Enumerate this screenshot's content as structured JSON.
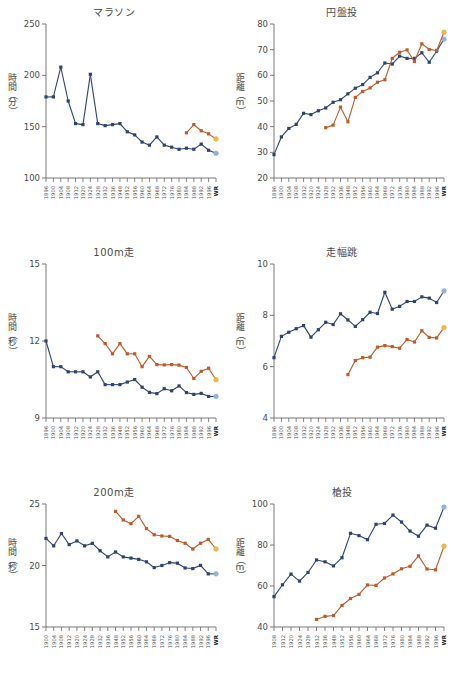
{
  "figure": {
    "background": "#ffffff",
    "series_colors": {
      "men": "#2e4373",
      "women": "#c05a28",
      "men_wr": "#8fb3d9",
      "women_wr": "#efb54a"
    },
    "legend_note": ""
  },
  "chart_data": [
    {
      "type": "line",
      "id": "marathon",
      "title": "マラソン",
      "ylabel_chars": [
        "時",
        "間",
        "（",
        "分",
        "）"
      ],
      "ylabel": "時間（分）",
      "xlabel": "",
      "ylim": [
        100,
        250
      ],
      "yticks": [
        100,
        150,
        200,
        250
      ],
      "grid": false,
      "categories": [
        "1896",
        "1900",
        "1904",
        "1908",
        "1912",
        "1920",
        "1924",
        "1928",
        "1932",
        "1936",
        "1948",
        "1952",
        "1956",
        "1960",
        "1964",
        "1968",
        "1972",
        "1976",
        "1980",
        "1984",
        "1988",
        "1992",
        "1996",
        "WR"
      ],
      "series": [
        {
          "name": "men",
          "color": "#2e4373",
          "last_is_wr": true,
          "values": [
            179,
            179,
            208,
            175,
            153,
            152,
            201,
            153,
            151,
            152,
            153,
            145,
            142,
            135,
            132,
            140,
            132,
            130,
            128,
            129,
            128,
            133,
            127,
            124
          ]
        },
        {
          "name": "women",
          "color": "#c05a28",
          "last_is_wr": true,
          "values": [
            null,
            null,
            null,
            null,
            null,
            null,
            null,
            null,
            null,
            null,
            null,
            null,
            null,
            null,
            null,
            null,
            null,
            null,
            null,
            144,
            152,
            146,
            143,
            138
          ]
        }
      ]
    },
    {
      "type": "line",
      "id": "discus",
      "title": "円盤投",
      "ylabel_chars": [
        "距",
        "離",
        "（",
        "m",
        "）"
      ],
      "ylabel": "距離（m）",
      "xlabel": "",
      "ylim": [
        20,
        80
      ],
      "yticks": [
        20,
        30,
        40,
        50,
        60,
        70,
        80
      ],
      "grid": false,
      "categories": [
        "1896",
        "1900",
        "1904",
        "1908",
        "1912",
        "1920",
        "1924",
        "1928",
        "1932",
        "1936",
        "1948",
        "1952",
        "1956",
        "1960",
        "1964",
        "1968",
        "1972",
        "1976",
        "1980",
        "1984",
        "1988",
        "1992",
        "1996",
        "WR"
      ],
      "series": [
        {
          "name": "men",
          "color": "#2e4373",
          "last_is_wr": true,
          "values": [
            29.1,
            36.0,
            39.3,
            40.9,
            45.2,
            44.7,
            46.2,
            47.3,
            49.5,
            50.5,
            52.8,
            55.0,
            56.4,
            59.2,
            61.0,
            64.8,
            64.4,
            67.5,
            66.6,
            66.6,
            68.8,
            65.1,
            69.4,
            74.1
          ]
        },
        {
          "name": "women",
          "color": "#c05a28",
          "last_is_wr": true,
          "values": [
            null,
            null,
            null,
            null,
            null,
            null,
            null,
            39.6,
            40.6,
            47.6,
            41.9,
            51.4,
            53.7,
            55.1,
            57.3,
            58.3,
            66.6,
            69.0,
            69.9,
            65.4,
            72.3,
            70.1,
            69.7,
            76.8
          ]
        }
      ]
    },
    {
      "type": "line",
      "id": "sprint100",
      "title": "100m走",
      "ylabel_chars": [
        "時",
        "間",
        "（",
        "秒",
        "）"
      ],
      "ylabel": "時間（秒）",
      "xlabel": "",
      "ylim": [
        9,
        15
      ],
      "yticks": [
        9,
        12,
        15
      ],
      "grid": false,
      "categories": [
        "1896",
        "1900",
        "1904",
        "1908",
        "1912",
        "1920",
        "1924",
        "1928",
        "1932",
        "1936",
        "1948",
        "1952",
        "1956",
        "1960",
        "1964",
        "1968",
        "1972",
        "1976",
        "1980",
        "1984",
        "1988",
        "1992",
        "1996",
        "WR"
      ],
      "series": [
        {
          "name": "men",
          "color": "#2e4373",
          "last_is_wr": true,
          "values": [
            12.0,
            11.0,
            11.0,
            10.8,
            10.8,
            10.8,
            10.6,
            10.8,
            10.3,
            10.3,
            10.3,
            10.4,
            10.5,
            10.2,
            10.0,
            9.95,
            10.14,
            10.06,
            10.25,
            9.99,
            9.92,
            9.96,
            9.84,
            9.84
          ]
        },
        {
          "name": "women",
          "color": "#c05a28",
          "last_is_wr": true,
          "values": [
            null,
            null,
            null,
            null,
            null,
            null,
            null,
            12.2,
            11.9,
            11.5,
            11.9,
            11.5,
            11.5,
            11.0,
            11.4,
            11.08,
            11.07,
            11.08,
            11.06,
            10.97,
            10.54,
            10.82,
            10.94,
            10.49
          ]
        }
      ]
    },
    {
      "type": "line",
      "id": "longjump",
      "title": "走幅跳",
      "ylabel_chars": [
        "距",
        "離",
        "（",
        "m",
        "）"
      ],
      "ylabel": "距離（m）",
      "xlabel": "",
      "ylim": [
        4,
        10
      ],
      "yticks": [
        4,
        6,
        8,
        10
      ],
      "grid": false,
      "categories": [
        "1896",
        "1900",
        "1904",
        "1908",
        "1912",
        "1920",
        "1924",
        "1928",
        "1932",
        "1936",
        "1948",
        "1952",
        "1956",
        "1960",
        "1964",
        "1968",
        "1972",
        "1976",
        "1980",
        "1984",
        "1988",
        "1992",
        "1996",
        "WR"
      ],
      "series": [
        {
          "name": "men",
          "color": "#2e4373",
          "last_is_wr": true,
          "values": [
            6.35,
            7.18,
            7.34,
            7.48,
            7.6,
            7.15,
            7.44,
            7.73,
            7.64,
            8.06,
            7.82,
            7.57,
            7.83,
            8.12,
            8.07,
            8.9,
            8.24,
            8.35,
            8.54,
            8.54,
            8.72,
            8.67,
            8.5,
            8.95
          ]
        },
        {
          "name": "women",
          "color": "#c05a28",
          "last_is_wr": true,
          "values": [
            null,
            null,
            null,
            null,
            null,
            null,
            null,
            null,
            null,
            null,
            5.69,
            6.24,
            6.35,
            6.37,
            6.76,
            6.82,
            6.78,
            6.72,
            7.06,
            6.96,
            7.4,
            7.14,
            7.12,
            7.52
          ]
        }
      ]
    },
    {
      "type": "line",
      "id": "sprint200",
      "title": "200m走",
      "ylabel_chars": [
        "時",
        "間",
        "（",
        "秒",
        "）"
      ],
      "ylabel": "時間（秒）",
      "xlabel": "",
      "ylim": [
        15,
        25
      ],
      "yticks": [
        15,
        20,
        25
      ],
      "grid": false,
      "categories": [
        "1900",
        "1904",
        "1908",
        "1912",
        "1920",
        "1924",
        "1928",
        "1932",
        "1936",
        "1948",
        "1952",
        "1956",
        "1960",
        "1964",
        "1968",
        "1972",
        "1976",
        "1980",
        "1984",
        "1988",
        "1992",
        "1996",
        "WR"
      ],
      "series": [
        {
          "name": "men",
          "color": "#2e4373",
          "last_is_wr": true,
          "values": [
            22.2,
            21.6,
            22.6,
            21.7,
            22.0,
            21.6,
            21.8,
            21.2,
            20.7,
            21.1,
            20.7,
            20.6,
            20.5,
            20.3,
            19.83,
            20.0,
            20.23,
            20.19,
            19.8,
            19.75,
            20.01,
            19.32,
            19.32
          ]
        },
        {
          "name": "women",
          "color": "#c05a28",
          "last_is_wr": true,
          "values": [
            null,
            null,
            null,
            null,
            null,
            null,
            null,
            null,
            null,
            24.4,
            23.7,
            23.4,
            24.0,
            23.0,
            22.5,
            22.4,
            22.37,
            22.03,
            21.81,
            21.34,
            21.81,
            22.12,
            21.34
          ]
        }
      ]
    },
    {
      "type": "line",
      "id": "javelin",
      "title": "槍投",
      "ylabel_chars": [
        "距",
        "離",
        "（",
        "m",
        "）"
      ],
      "ylabel": "距離（m）",
      "xlabel": "",
      "ylim": [
        40,
        100
      ],
      "yticks": [
        40,
        60,
        80,
        100
      ],
      "grid": false,
      "categories": [
        "1908",
        "1912",
        "1920",
        "1924",
        "1928",
        "1932",
        "1936",
        "1948",
        "1952",
        "1956",
        "1960",
        "1964",
        "1968",
        "1972",
        "1976",
        "1980",
        "1984",
        "1988",
        "1992",
        "1996",
        "WR"
      ],
      "series": [
        {
          "name": "men",
          "color": "#2e4373",
          "last_is_wr": true,
          "values": [
            54.8,
            60.6,
            65.8,
            62.4,
            66.6,
            72.7,
            71.8,
            69.8,
            73.8,
            85.7,
            84.6,
            82.6,
            90.1,
            90.5,
            94.6,
            91.2,
            86.8,
            84.3,
            89.7,
            88.2,
            98.5
          ]
        },
        {
          "name": "women",
          "color": "#c05a28",
          "last_is_wr": true,
          "values": [
            null,
            null,
            null,
            null,
            null,
            43.7,
            45.2,
            45.6,
            50.5,
            53.9,
            55.9,
            60.5,
            60.3,
            63.9,
            65.9,
            68.4,
            69.6,
            74.7,
            68.3,
            67.9,
            79.4
          ]
        }
      ]
    }
  ]
}
